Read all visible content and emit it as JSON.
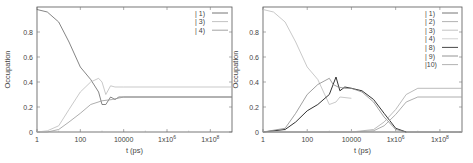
{
  "chart_data": [
    {
      "type": "line",
      "xlabel": "t (ps)",
      "ylabel": "Occupation",
      "xscale": "log",
      "xlim": [
        1,
        1000000000
      ],
      "ylim": [
        0,
        1
      ],
      "grid": false,
      "legend_position": "top-right",
      "xticks": [
        "1",
        "100",
        "10000",
        "1x10^6",
        "1x10^8"
      ],
      "yticks": [
        "0",
        "0.2",
        "0.4",
        "0.6",
        "0.8"
      ],
      "series": [
        {
          "name": "| 1)",
          "color": "#666666",
          "x": [
            1,
            3,
            10,
            30,
            100,
            300,
            700,
            1000,
            1500,
            2500,
            4000,
            6000,
            10000,
            1000000000
          ],
          "values": [
            0.98,
            0.96,
            0.88,
            0.72,
            0.52,
            0.42,
            0.32,
            0.22,
            0.22,
            0.28,
            0.26,
            0.28,
            0.28,
            0.28
          ]
        },
        {
          "name": "| 3)",
          "color": "#bbbbbb",
          "x": [
            1,
            3,
            10,
            30,
            100,
            300,
            700,
            1000,
            1500,
            2500,
            4000,
            10000,
            1000000000
          ],
          "values": [
            0.0,
            0.01,
            0.05,
            0.18,
            0.32,
            0.4,
            0.43,
            0.4,
            0.3,
            0.37,
            0.36,
            0.36,
            0.36
          ]
        },
        {
          "name": "| 4)",
          "color": "#999999",
          "x": [
            1,
            3,
            10,
            30,
            100,
            300,
            1000,
            3000,
            10000,
            1000000000
          ],
          "values": [
            0.0,
            0.0,
            0.02,
            0.08,
            0.15,
            0.22,
            0.25,
            0.26,
            0.28,
            0.28
          ]
        }
      ]
    },
    {
      "type": "line",
      "xlabel": "t (ps)",
      "ylabel": "Occupation",
      "xscale": "log",
      "xlim": [
        1,
        1000000000
      ],
      "ylim": [
        0,
        1
      ],
      "grid": false,
      "legend_position": "top-right",
      "xticks": [
        "1",
        "100",
        "10000",
        "1x10^6",
        "1x10^8"
      ],
      "yticks": [
        "0",
        "0.2",
        "0.4",
        "0.6",
        "0.8"
      ],
      "series": [
        {
          "name": "| 1)",
          "color": "#666666",
          "x": [
            1,
            1000000000
          ],
          "values": [
            0.0,
            0.0
          ]
        },
        {
          "name": "| 2)",
          "color": "#aaaaaa",
          "x": [
            1,
            10,
            100,
            1000000000
          ],
          "values": [
            0.0,
            0.0,
            0.0,
            0.0
          ]
        },
        {
          "name": "| 3)",
          "color": "#bbbbbb",
          "x": [
            1,
            3,
            10,
            30,
            100,
            300,
            1000,
            2000,
            3000,
            10000
          ],
          "values": [
            0.98,
            0.96,
            0.88,
            0.72,
            0.52,
            0.42,
            0.22,
            0.24,
            0.28,
            0.27
          ]
        },
        {
          "name": "| 4)",
          "color": "#cccccc",
          "x": [
            1,
            1000000000
          ],
          "values": [
            0.0,
            0.0
          ]
        },
        {
          "name": "| 8)",
          "color": "#333333",
          "x": [
            1,
            10,
            30,
            100,
            300,
            1000,
            2000,
            3000,
            5000,
            10000,
            30000,
            100000,
            300000,
            1000000,
            3000000
          ],
          "values": [
            0.0,
            0.02,
            0.08,
            0.17,
            0.22,
            0.3,
            0.44,
            0.33,
            0.36,
            0.35,
            0.33,
            0.26,
            0.15,
            0.03,
            0.0
          ]
        },
        {
          "name": "| 9)",
          "color": "#888888",
          "x": [
            1,
            10,
            30,
            100,
            300,
            1000,
            1500,
            2500,
            5000,
            10000,
            30000,
            100000,
            300000,
            1000000,
            3000000,
            10000000,
            1000000000
          ],
          "values": [
            0.0,
            0.03,
            0.15,
            0.3,
            0.38,
            0.43,
            0.38,
            0.36,
            0.35,
            0.35,
            0.32,
            0.24,
            0.12,
            0.02,
            0.0,
            0.0,
            0.0
          ]
        },
        {
          "name": "|10)",
          "color": "#aaaaaa",
          "x": [
            1,
            10000,
            100000,
            300000,
            1000000,
            3000000,
            10000000,
            1000000000
          ],
          "values": [
            0.0,
            0.0,
            0.02,
            0.08,
            0.18,
            0.3,
            0.35,
            0.35
          ]
        },
        {
          "name": "|10b)",
          "color": "#999999",
          "x": [
            1,
            10000,
            100000,
            300000,
            1000000,
            3000000,
            10000000,
            1000000000
          ],
          "values": [
            0.0,
            0.0,
            0.01,
            0.05,
            0.14,
            0.24,
            0.28,
            0.28
          ]
        }
      ]
    }
  ],
  "panels": [
    {
      "ylabel": "Occupation",
      "xlabel": "t (ps)",
      "legend": [
        "| 1)",
        "| 3)",
        "| 4)"
      ]
    },
    {
      "ylabel": "Occupation",
      "xlabel": "t (ps)",
      "legend": [
        "| 1)",
        "| 2)",
        "| 3)",
        "| 4)",
        "| 8)",
        "| 9)",
        "|10)"
      ]
    }
  ]
}
